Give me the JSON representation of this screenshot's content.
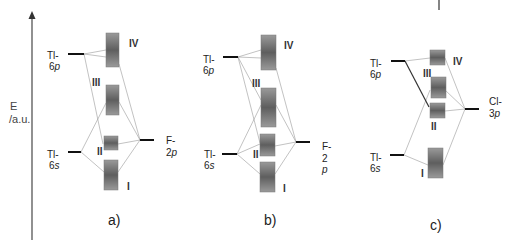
{
  "axis": {
    "label_line1": "E",
    "label_line2": "/a.u."
  },
  "panels": [
    {
      "id": "a",
      "caption": "a)",
      "left_levels": [
        {
          "label1": "Tl-",
          "label2": "6",
          "label2_italic": "p"
        },
        {
          "label1": "Tl-",
          "label2": "6",
          "label2_italic": "s"
        }
      ],
      "right_level": {
        "label1": "F-",
        "label2": "2",
        "label2_italic": "p"
      },
      "orbitals": [
        "IV",
        "III",
        "II",
        "I"
      ]
    },
    {
      "id": "b",
      "caption": "b)",
      "left_levels": [
        {
          "label1": "Tl-",
          "label2": "6",
          "label2_italic": "p"
        },
        {
          "label1": "Tl-",
          "label2": "6",
          "label2_italic": "s"
        }
      ],
      "right_level": {
        "label1": "F-",
        "label2": "2",
        "label2_italic": "p"
      },
      "orbitals": [
        "IV",
        "III",
        "II",
        "I"
      ]
    },
    {
      "id": "c",
      "caption": "c)",
      "left_levels": [
        {
          "label1": "Tl-",
          "label2": "6",
          "label2_italic": "p"
        },
        {
          "label1": "Tl-",
          "label2": "6",
          "label2_italic": "s"
        }
      ],
      "right_level": {
        "label1": "Cl-",
        "label2": "3",
        "label2_italic": "p"
      },
      "orbitals": [
        "IV",
        "III",
        "II",
        "I"
      ]
    }
  ]
}
